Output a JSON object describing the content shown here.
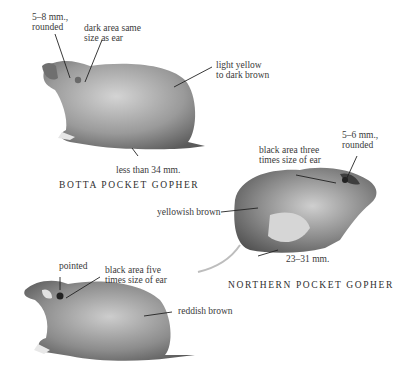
{
  "plate": {
    "species": [
      {
        "name": "BOTTA POCKET GOPHER",
        "callouts": {
          "ear": "5–8 mm.,\nrounded",
          "ear_patch": "dark area same\nsize as ear",
          "color": "light yellow\nto dark brown",
          "hind_foot": "less than 34 mm."
        }
      },
      {
        "name": "NORTHERN POCKET GOPHER",
        "callouts": {
          "ear_patch": "black area three\ntimes size of ear",
          "ear": "5–6 mm.,\nrounded",
          "color": "yellowish brown",
          "hind_foot": "23–31 mm."
        }
      },
      {
        "name": "",
        "callouts": {
          "ear": "pointed",
          "ear_patch": "black area five\ntimes size of ear",
          "color": "reddish brown"
        }
      }
    ]
  },
  "colors": {
    "fur_light": "#c9c9c9",
    "fur_mid": "#8f8f8f",
    "fur_dark": "#555555",
    "leader_line": "#222222"
  }
}
